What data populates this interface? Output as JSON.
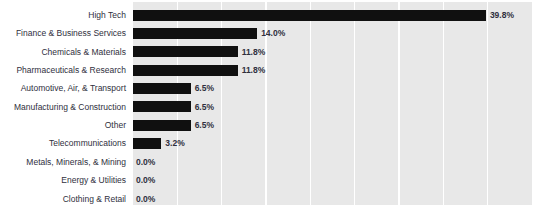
{
  "chart_data": {
    "type": "bar",
    "orientation": "horizontal",
    "title": "",
    "xlabel": "",
    "ylabel": "",
    "xlim": [
      0,
      45
    ],
    "xtick_step": 5,
    "grid": "vertical-white",
    "legend": "none",
    "value_suffix": "%",
    "bar_color": "#101010",
    "plot_background": "#e8e8e8",
    "gridline_color": "#ffffff",
    "label_color": "#2f2f3d",
    "categories": [
      "High Tech",
      "Finance & Business Services",
      "Chemicals & Materials",
      "Pharmaceuticals & Research",
      "Automotive, Air, & Transport",
      "Manufacturing & Construction",
      "Other",
      "Telecommunications",
      "Metals, Minerals, & Mining",
      "Energy & Utilities",
      "Clothing & Retail"
    ],
    "values": [
      39.8,
      14.0,
      11.8,
      11.8,
      6.5,
      6.5,
      6.5,
      3.2,
      0.0,
      0.0,
      0.0
    ],
    "value_labels": [
      "39.8%",
      "14.0%",
      "11.8%",
      "11.8%",
      "6.5%",
      "6.5%",
      "6.5%",
      "3.2%",
      "0.0%",
      "0.0%",
      "0.0%"
    ]
  }
}
